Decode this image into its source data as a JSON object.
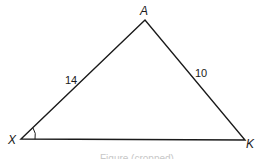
{
  "diagram": {
    "type": "triangle",
    "vertices": [
      {
        "name": "A",
        "label": "A"
      },
      {
        "name": "X",
        "label": "X"
      },
      {
        "name": "K",
        "label": "K"
      }
    ],
    "sides": [
      {
        "between": "X-A",
        "length_label": "14"
      },
      {
        "between": "A-K",
        "length_label": "10"
      },
      {
        "between": "X-K",
        "length_label": ""
      }
    ],
    "angle_marks": [
      {
        "vertex": "X",
        "style": "single arc"
      }
    ],
    "stroke_color": "#1a1a1a",
    "background": "#ffffff",
    "caption": "Figure (cropped)"
  }
}
